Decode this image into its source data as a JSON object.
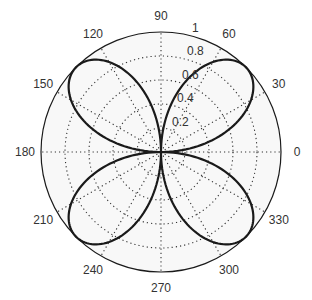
{
  "chart_data": {
    "type": "line",
    "projection": "polar",
    "title": "",
    "series": [
      {
        "name": "r = |sin(2θ)|",
        "equation": "r = |sin(2*theta)|",
        "color": "#1a1a1a",
        "samples": 360
      }
    ],
    "angle_ticks": [
      "0",
      "30",
      "60",
      "90",
      "120",
      "150",
      "180",
      "210",
      "240",
      "270",
      "300",
      "330"
    ],
    "radial_ticks": [
      "0.2",
      "0.4",
      "0.6",
      "0.8",
      "1"
    ],
    "rlim": [
      0,
      1
    ],
    "grid": true,
    "legend": null
  },
  "colors": {
    "axis": "#1a1a1a",
    "grid": "#333333",
    "curve": "#1a1a1a",
    "background": "#f8f8f8"
  }
}
